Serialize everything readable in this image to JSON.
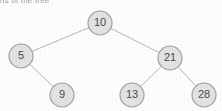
{
  "figure": {
    "width": 222,
    "height": 111,
    "background_color": "#fdfdfd",
    "clipped_caption": {
      "text": "ns  of the tree",
      "note": "bottom sliver of a text line cropped at the top edge of the image"
    }
  },
  "style": {
    "node_fill": "#e2e2e2",
    "node_stroke": "#9d9d9d",
    "node_text_color": "#4a4a4a",
    "edge_color": "#b4b4b4",
    "node_radius": 12,
    "node_font_size": 11
  },
  "chart_data": {
    "type": "diagram",
    "diagram_type": "binary-search-tree",
    "title": "",
    "root": "10",
    "nodes": [
      {
        "id": "n10",
        "label": "10",
        "x": 100,
        "y": 23,
        "level": 0,
        "parent": null,
        "side": "root"
      },
      {
        "id": "n5",
        "label": "5",
        "x": 21,
        "y": 56,
        "level": 1,
        "parent": "n10",
        "side": "left"
      },
      {
        "id": "n21",
        "label": "21",
        "x": 170,
        "y": 58,
        "level": 1,
        "parent": "n10",
        "side": "right"
      },
      {
        "id": "n9",
        "label": "9",
        "x": 62,
        "y": 95,
        "level": 2,
        "parent": "n5",
        "side": "right"
      },
      {
        "id": "n13",
        "label": "13",
        "x": 132,
        "y": 95,
        "level": 2,
        "parent": "n21",
        "side": "left"
      },
      {
        "id": "n28",
        "label": "28",
        "x": 204,
        "y": 95,
        "level": 2,
        "parent": "n21",
        "side": "right"
      }
    ],
    "edges": [
      {
        "from": "n10",
        "to": "n5",
        "x1": 100,
        "y1": 23,
        "x2": 21,
        "y2": 56
      },
      {
        "from": "n10",
        "to": "n21",
        "x1": 100,
        "y1": 23,
        "x2": 170,
        "y2": 58
      },
      {
        "from": "n5",
        "to": "n9",
        "x1": 21,
        "y1": 56,
        "x2": 62,
        "y2": 95
      },
      {
        "from": "n21",
        "to": "n13",
        "x1": 170,
        "y1": 58,
        "x2": 132,
        "y2": 95
      },
      {
        "from": "n21",
        "to": "n28",
        "x1": 170,
        "y1": 58,
        "x2": 204,
        "y2": 95
      }
    ],
    "values": [
      10,
      5,
      21,
      9,
      13,
      28
    ],
    "inorder": [
      5,
      9,
      10,
      13,
      21,
      28
    ]
  }
}
